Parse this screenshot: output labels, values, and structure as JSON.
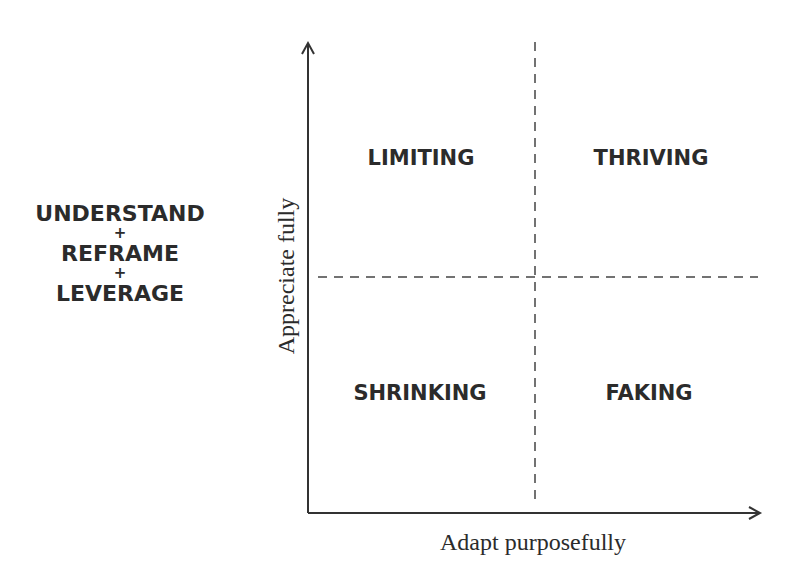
{
  "diagram": {
    "type": "2x2 quadrant matrix",
    "process_steps": {
      "step1": "UNDERSTAND",
      "plus1": "+",
      "step2": "REFRAME",
      "plus2": "+",
      "step3": "LEVERAGE"
    },
    "axes": {
      "x_label": "Adapt purposefully",
      "y_label": "Appreciate fully"
    },
    "quadrants": {
      "top_left": "LIMITING",
      "top_right": "THRIVING",
      "bottom_left": "SHRINKING",
      "bottom_right": "FAKING"
    },
    "colors": {
      "text": "#2b2b2b",
      "axis": "#333333",
      "divider": "#444444",
      "background": "#ffffff"
    }
  }
}
